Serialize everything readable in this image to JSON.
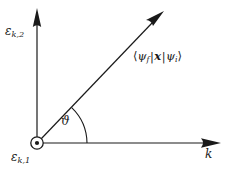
{
  "figure": {
    "type": "vector-diagram",
    "background_color": "#ffffff",
    "stroke_color": "#1a1a1a",
    "canvas": {
      "width": 240,
      "height": 169
    }
  },
  "axes": {
    "vertical": {
      "label_epsilon": "ε",
      "label_subscript": "k,2",
      "origin": {
        "x": 37,
        "y": 143
      },
      "tip": {
        "x": 37,
        "y": 10
      }
    },
    "horizontal": {
      "label": "k",
      "origin": {
        "x": 37,
        "y": 143
      },
      "tip": {
        "x": 219,
        "y": 143
      }
    },
    "out_of_page": {
      "label_epsilon": "ε",
      "label_subscript": "k,1",
      "symbol": "circle-dot-icon",
      "center": {
        "x": 37,
        "y": 143
      },
      "radius": 6
    }
  },
  "vector": {
    "label_open_bracket": "⟨",
    "label_psi_f": "ψ",
    "label_psi_f_sub": "f",
    "label_bar": "|",
    "label_operator": "x",
    "label_psi_i": "ψ",
    "label_psi_i_sub": "i",
    "label_close_bracket": "⟩",
    "origin": {
      "x": 37,
      "y": 143
    },
    "tip": {
      "x": 163,
      "y": 12
    },
    "angle_degrees": 46
  },
  "angle": {
    "label": "ϑ",
    "arc_radius": 50,
    "start_degrees": 0,
    "end_degrees": 46
  }
}
